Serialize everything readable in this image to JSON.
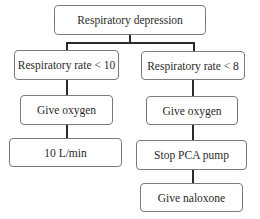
{
  "diagram": {
    "type": "flowchart",
    "root": {
      "label": "Respiratory depression"
    },
    "branches": [
      {
        "condition": "Respiratory rate < 10",
        "steps": [
          "Give oxygen",
          "10 L/min"
        ]
      },
      {
        "condition": "Respiratory rate < 8",
        "steps": [
          "Give oxygen",
          "Stop PCA pump",
          "Give naloxone"
        ]
      }
    ],
    "colors": {
      "box_border": "#7a7a7a",
      "connector": "#2b2b2b",
      "text": "#2a2a2a",
      "background": "#ffffff"
    }
  }
}
